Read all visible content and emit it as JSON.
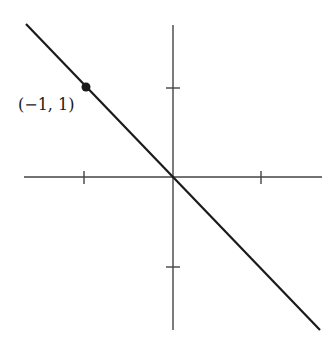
{
  "diagram": {
    "type": "coordinate-plane-line",
    "axes": {
      "x_range": [
        -2,
        2
      ],
      "y_range": [
        -2,
        2
      ],
      "ticks": {
        "x": [
          -1,
          1
        ],
        "y": [
          -1,
          1
        ]
      }
    },
    "line": {
      "equation": "y = -x",
      "from": [
        -2,
        2
      ],
      "to": [
        2,
        -2
      ]
    },
    "point": {
      "x": -1,
      "y": 1,
      "label": "(−1,  1)"
    },
    "colors": {
      "ink": "#1a1a1a",
      "axis": "#444444",
      "background": "#ffffff"
    }
  }
}
